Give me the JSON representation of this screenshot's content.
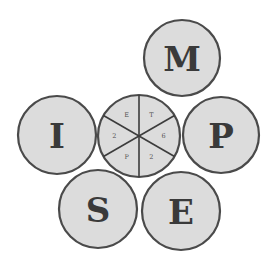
{
  "diagram": {
    "colors": {
      "fill": "#dcdcdc",
      "stroke": "#4a4a4a",
      "letter": "#3a3a3a"
    },
    "outer_circles": [
      {
        "id": "m",
        "letter": "M",
        "cx": 182,
        "cy": 58,
        "r": 38
      },
      {
        "id": "i",
        "letter": "I",
        "cx": 57,
        "cy": 135,
        "r": 39
      },
      {
        "id": "p",
        "letter": "P",
        "cx": 221,
        "cy": 135,
        "r": 38
      },
      {
        "id": "s",
        "letter": "S",
        "cx": 98,
        "cy": 209,
        "r": 39
      },
      {
        "id": "e",
        "letter": "E",
        "cx": 181,
        "cy": 211,
        "r": 39
      }
    ],
    "center_circle": {
      "cx": 139,
      "cy": 136,
      "r": 41,
      "segments": [
        "E",
        "T",
        "6",
        "2",
        "P",
        "2"
      ]
    }
  }
}
